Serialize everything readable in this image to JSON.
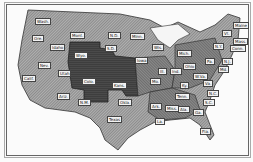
{
  "map": {
    "title": "",
    "colors": {
      "light": "#9a9a9a",
      "medium": "#6e6e6e",
      "dark": "#3e3e3e",
      "background": "#fbfbfb"
    },
    "labels": [
      {
        "text": "Wash.",
        "x": 35,
        "y": 18
      },
      {
        "text": "Ore.",
        "x": 32,
        "y": 35
      },
      {
        "text": "Idaho",
        "x": 50,
        "y": 44
      },
      {
        "text": "Mont.",
        "x": 70,
        "y": 32
      },
      {
        "text": "Wyo.",
        "x": 74,
        "y": 52
      },
      {
        "text": "N.D.",
        "x": 108,
        "y": 32
      },
      {
        "text": "S.D.",
        "x": 105,
        "y": 45
      },
      {
        "text": "Nev.",
        "x": 38,
        "y": 62
      },
      {
        "text": "Utah",
        "x": 58,
        "y": 70
      },
      {
        "text": "Calif.",
        "x": 22,
        "y": 75
      },
      {
        "text": "Colo.",
        "x": 82,
        "y": 78
      },
      {
        "text": "Kans.",
        "x": 112,
        "y": 82
      },
      {
        "text": "Ariz.",
        "x": 57,
        "y": 93
      },
      {
        "text": "N.M.",
        "x": 78,
        "y": 99
      },
      {
        "text": "Okla.",
        "x": 118,
        "y": 99
      },
      {
        "text": "Texas",
        "x": 107,
        "y": 116
      },
      {
        "text": "Minn.",
        "x": 130,
        "y": 33
      },
      {
        "text": "Iowa",
        "x": 135,
        "y": 57
      },
      {
        "text": "Mo.",
        "x": 150,
        "y": 78
      },
      {
        "text": "Ark.",
        "x": 150,
        "y": 103
      },
      {
        "text": "La.",
        "x": 155,
        "y": 118
      },
      {
        "text": "Wis.",
        "x": 152,
        "y": 44
      },
      {
        "text": "Ill.",
        "x": 158,
        "y": 68
      },
      {
        "text": "Mich.",
        "x": 177,
        "y": 50
      },
      {
        "text": "Ind.",
        "x": 170,
        "y": 68
      },
      {
        "text": "Ohio",
        "x": 183,
        "y": 63
      },
      {
        "text": "Ky.",
        "x": 180,
        "y": 82
      },
      {
        "text": "Tenn.",
        "x": 175,
        "y": 93
      },
      {
        "text": "Miss.",
        "x": 165,
        "y": 105
      },
      {
        "text": "Ala.",
        "x": 178,
        "y": 106
      },
      {
        "text": "Ga.",
        "x": 193,
        "y": 109
      },
      {
        "text": "Fla.",
        "x": 200,
        "y": 128
      },
      {
        "text": "S.C.",
        "x": 203,
        "y": 99
      },
      {
        "text": "N.C.",
        "x": 207,
        "y": 90
      },
      {
        "text": "Va.",
        "x": 203,
        "y": 80
      },
      {
        "text": "W.Va.",
        "x": 193,
        "y": 73
      },
      {
        "text": "Pa.",
        "x": 205,
        "y": 58
      },
      {
        "text": "N.Y.",
        "x": 213,
        "y": 43
      },
      {
        "text": "Md.",
        "x": 218,
        "y": 66
      },
      {
        "text": "N.J.",
        "x": 222,
        "y": 58
      },
      {
        "text": "Conn.",
        "x": 230,
        "y": 45
      },
      {
        "text": "Mass.",
        "x": 233,
        "y": 38
      },
      {
        "text": "Vt.",
        "x": 222,
        "y": 30
      },
      {
        "text": "Maine",
        "x": 233,
        "y": 22
      }
    ]
  }
}
